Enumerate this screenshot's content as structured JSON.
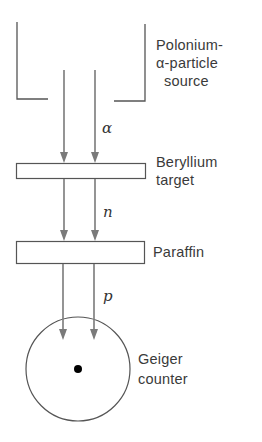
{
  "diagram": {
    "components": {
      "source": {
        "lines": [
          "Polonium-",
          "α-particle",
          "source"
        ]
      },
      "beryllium": {
        "lines": [
          "Beryllium",
          "target"
        ]
      },
      "paraffin": {
        "lines": [
          "Paraffin"
        ]
      },
      "geiger": {
        "lines": [
          "Geiger",
          "counter"
        ]
      }
    },
    "particles": {
      "alpha": "α",
      "neutron": "n",
      "proton": "p"
    },
    "colors": {
      "outline": "#555555",
      "arrow": "#7a7a7a",
      "text": "#3a3a3a",
      "dot": "#000000"
    }
  }
}
